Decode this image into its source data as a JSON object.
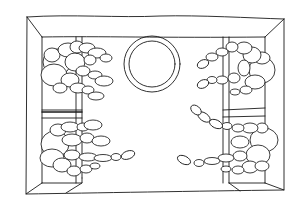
{
  "figure": {
    "description": "Line drawing: top-down view of a box-shaped room with four seated mannequin figures on two bench columns and a circle in the center",
    "style": "black ink line art on white",
    "colors": {
      "background": "#ffffff",
      "ink": "#1a1a1a"
    },
    "elements": {
      "room": "open box with back wall and two side walls",
      "left_bench": "vertical bench column on the left",
      "right_bench": "vertical bench column on the right",
      "circle": "double-outlined circle near the top center",
      "figures": [
        {
          "position": "top-left",
          "pose": "curled, arms reaching right"
        },
        {
          "position": "bottom-left",
          "pose": "seated, arm and leg extended right"
        },
        {
          "position": "top-right",
          "pose": "curled, arms reaching left"
        },
        {
          "position": "bottom-right",
          "pose": "seated, arm raised and leg extended left"
        }
      ]
    }
  }
}
